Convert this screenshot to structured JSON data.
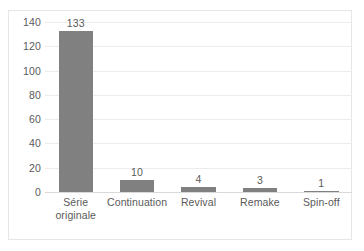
{
  "chart_data": {
    "type": "bar",
    "title": "",
    "subtitle": "",
    "xlabel": "",
    "ylabel": "",
    "categories": [
      "Série originale",
      "Continuation",
      "Revival",
      "Remake",
      "Spin-off"
    ],
    "category_lines": [
      [
        "Série",
        "originale"
      ],
      [
        "Continuation"
      ],
      [
        "Revival"
      ],
      [
        "Remake"
      ],
      [
        "Spin-off"
      ]
    ],
    "values": [
      133,
      10,
      4,
      3,
      1
    ],
    "data_labels": [
      "133",
      "10",
      "4",
      "3",
      "1"
    ],
    "ylim": [
      0,
      140
    ],
    "ytick_step": 20,
    "ytick_labels": [
      "140",
      "120",
      "100",
      "80",
      "60",
      "40",
      "20",
      "0"
    ],
    "ytick_values": [
      140,
      120,
      100,
      80,
      60,
      40,
      20,
      0
    ],
    "grid": true,
    "grid_axis": "y",
    "legend": false,
    "legend_position": "none",
    "orientation": "vertical",
    "colors": {
      "bar": "#808080",
      "text": "#5a5a5a",
      "gridline": "#ececec",
      "baseline": "#d9d9d9",
      "frame": "#e6e6e6",
      "background": "#ffffff"
    }
  }
}
